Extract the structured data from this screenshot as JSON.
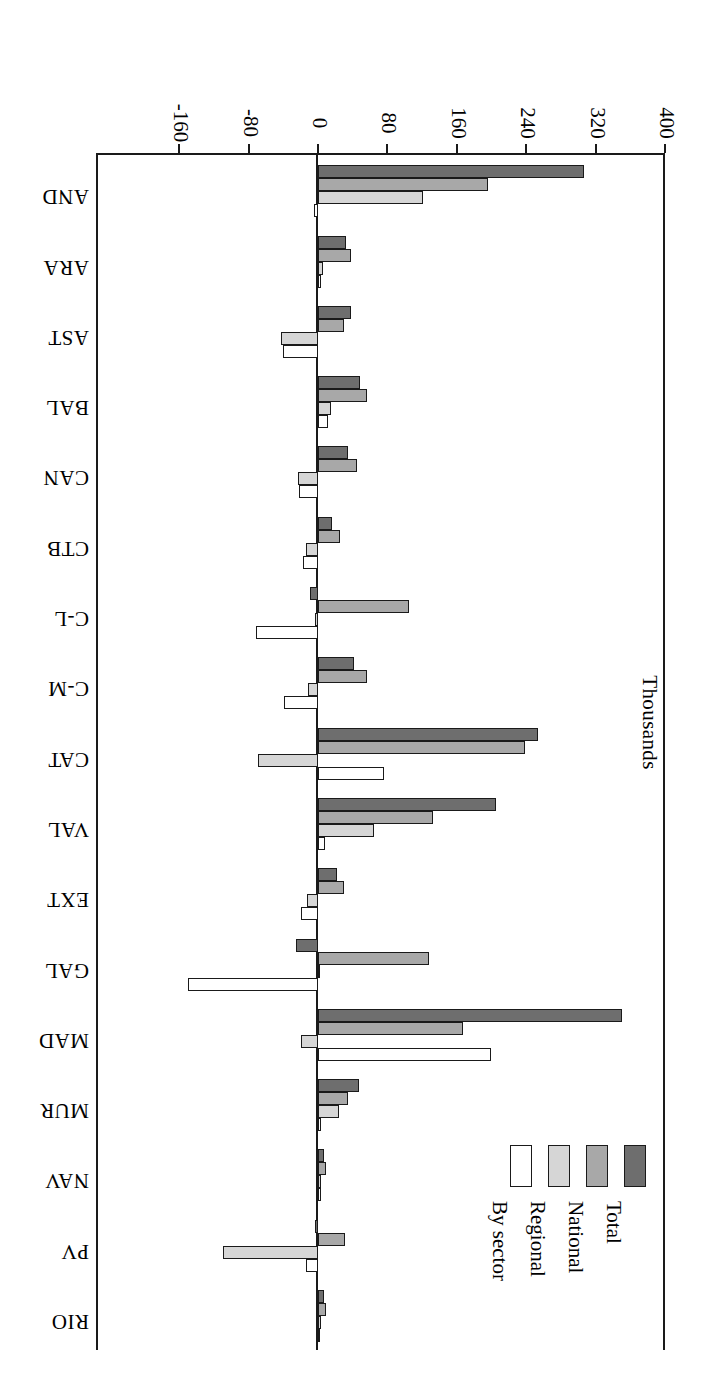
{
  "chart_data": {
    "type": "bar",
    "orientation": "horizontal-grouped",
    "title": "",
    "xlabel": "",
    "ylabel": "Thousands",
    "axis_title": "Thousands",
    "categories": [
      "AND",
      "ARA",
      "AST",
      "BAL",
      "CAN",
      "CTB",
      "C-L",
      "C-M",
      "CAT",
      "VAL",
      "EXT",
      "GAL",
      "MAD",
      "MUR",
      "NAV",
      "PV",
      "RIO"
    ],
    "tick_labels": [
      "400",
      "320",
      "240",
      "160",
      "80",
      "0",
      "-80",
      "-160"
    ],
    "tick_values": [
      400,
      320,
      240,
      160,
      80,
      0,
      -80,
      -160
    ],
    "xlim": [
      -160,
      400
    ],
    "grid": false,
    "legend_position": "upper-left",
    "legend": [
      "Total",
      "National",
      "Regional",
      "By sector"
    ],
    "series": [
      {
        "name": "Total",
        "color": "#6e6e6e",
        "values": [
          307,
          32,
          38,
          48,
          35,
          16,
          -9,
          41,
          254,
          205,
          22,
          -25,
          351,
          47,
          7,
          -4,
          7
        ]
      },
      {
        "name": "National",
        "color": "#a8a8a8",
        "values": [
          196,
          38,
          30,
          57,
          45,
          25,
          105,
          57,
          239,
          133,
          30,
          128,
          167,
          35,
          9,
          31,
          9
        ]
      },
      {
        "name": "Regional",
        "color": "#d6d6d6",
        "values": [
          121,
          6,
          -43,
          15,
          -23,
          -14,
          -3,
          -11,
          -69,
          64,
          -13,
          2,
          -20,
          24,
          4,
          -110,
          3
        ]
      },
      {
        "name": "By sector",
        "color": "#ffffff",
        "values": [
          -5,
          3,
          -40,
          12,
          -22,
          -17,
          -71,
          -39,
          76,
          8,
          -20,
          -150,
          199,
          3,
          3,
          -14,
          2
        ]
      }
    ]
  },
  "legend": {
    "items": [
      {
        "label": "Total",
        "swatch": "total"
      },
      {
        "label": "National",
        "swatch": "national"
      },
      {
        "label": "Regional",
        "swatch": "regional"
      },
      {
        "label": "By sector",
        "swatch": "sector"
      }
    ]
  },
  "axis": {
    "title": "Thousands",
    "ticks": [
      "400",
      "320",
      "240",
      "160",
      "80",
      "0",
      "-80",
      "-160"
    ]
  },
  "colors": {
    "total": "#6e6e6e",
    "national": "#a8a8a8",
    "regional": "#d6d6d6",
    "sector": "#ffffff",
    "frame": "#1a1a1a"
  }
}
